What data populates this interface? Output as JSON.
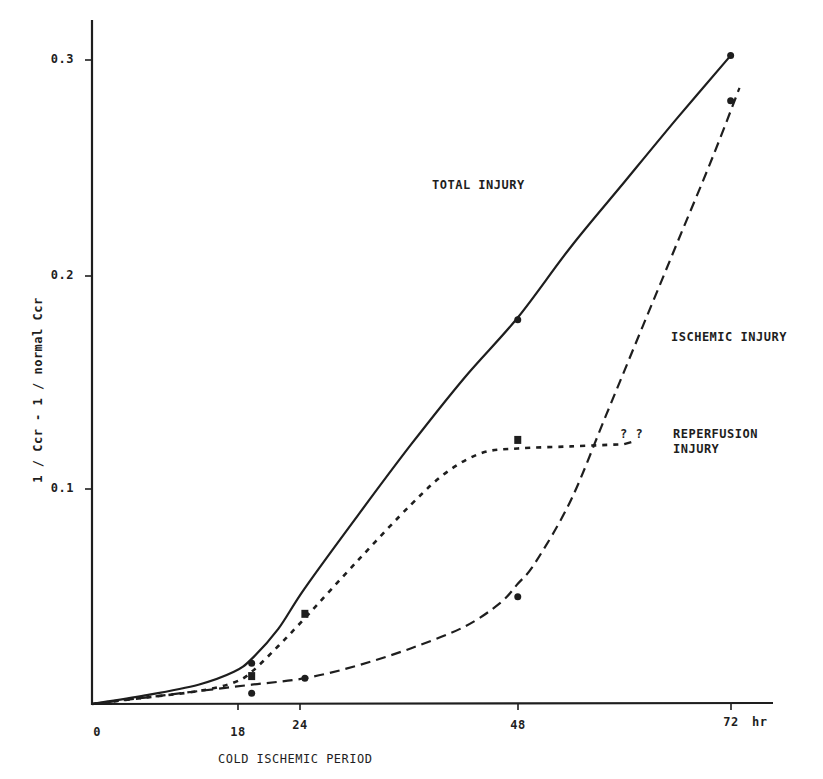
{
  "chart_data": {
    "type": "line",
    "title": "",
    "xlabel": "COLD ISCHEMIC PERIOD",
    "x_unit": "hr",
    "ylabel": "1 / Ccr - 1 / normal Ccr",
    "x_ticks": [
      "0",
      "18",
      "24",
      "48",
      "72"
    ],
    "y_ticks": [
      "0.1",
      "0.2",
      "0.3"
    ],
    "xlim": [
      0,
      77
    ],
    "ylim": [
      0,
      0.32
    ],
    "grid": false,
    "legend_position": "inline labels",
    "series": [
      {
        "name": "TOTAL INJURY",
        "line_style": "solid",
        "marker": "circle",
        "points": [
          {
            "x": 18,
            "y": 0.019
          },
          {
            "x": 48,
            "y": 0.179
          },
          {
            "x": 72,
            "y": 0.302
          }
        ],
        "curve": [
          [
            0,
            0
          ],
          [
            6,
            0.004
          ],
          [
            12,
            0.009
          ],
          [
            16,
            0.015
          ],
          [
            18,
            0.021
          ],
          [
            21,
            0.035
          ],
          [
            24,
            0.054
          ],
          [
            30,
            0.088
          ],
          [
            36,
            0.121
          ],
          [
            42,
            0.152
          ],
          [
            48,
            0.18
          ],
          [
            54,
            0.213
          ],
          [
            60,
            0.243
          ],
          [
            66,
            0.273
          ],
          [
            72,
            0.302
          ]
        ]
      },
      {
        "name": "REPERFUSION INJURY",
        "line_style": "dotted",
        "marker": "square",
        "points": [
          {
            "x": 18,
            "y": 0.013
          },
          {
            "x": 24,
            "y": 0.042
          },
          {
            "x": 48,
            "y": 0.123
          }
        ],
        "curve": [
          [
            0,
            0
          ],
          [
            6,
            0.003
          ],
          [
            12,
            0.006
          ],
          [
            16,
            0.01
          ],
          [
            18,
            0.015
          ],
          [
            21,
            0.027
          ],
          [
            24,
            0.04
          ],
          [
            30,
            0.067
          ],
          [
            36,
            0.093
          ],
          [
            40,
            0.108
          ],
          [
            44,
            0.117
          ],
          [
            48,
            0.119
          ],
          [
            54,
            0.12
          ],
          [
            60,
            0.121
          ]
        ],
        "annotation": "? ?"
      },
      {
        "name": "ISCHEMIC INJURY",
        "line_style": "dashed",
        "marker": "circle",
        "points": [
          {
            "x": 18,
            "y": 0.005
          },
          {
            "x": 24,
            "y": 0.012
          },
          {
            "x": 48,
            "y": 0.05
          },
          {
            "x": 72,
            "y": 0.281
          }
        ],
        "curve": [
          [
            0,
            0
          ],
          [
            6,
            0.003
          ],
          [
            12,
            0.006
          ],
          [
            18,
            0.009
          ],
          [
            24,
            0.012
          ],
          [
            30,
            0.018
          ],
          [
            36,
            0.026
          ],
          [
            42,
            0.036
          ],
          [
            46,
            0.047
          ],
          [
            48,
            0.056
          ],
          [
            50,
            0.066
          ],
          [
            54,
            0.095
          ],
          [
            58,
            0.135
          ],
          [
            62,
            0.175
          ],
          [
            66,
            0.215
          ],
          [
            70,
            0.255
          ],
          [
            73,
            0.287
          ]
        ]
      }
    ],
    "annotations": [
      {
        "text": "TOTAL INJURY"
      },
      {
        "text": "ISCHEMIC INJURY"
      },
      {
        "text": "? ?"
      },
      {
        "text": "REPERFUSION"
      },
      {
        "text": "INJURY"
      }
    ]
  },
  "labels": {
    "y_axis_title": "1 / Ccr  -  1 / normal Ccr",
    "x_axis_title": "COLD ISCHEMIC PERIOD",
    "x_unit": "hr",
    "x_ticks": [
      "0",
      "18",
      "24",
      "48",
      "72"
    ],
    "y_ticks": [
      "0.1",
      "0.2",
      "0.3"
    ],
    "total_injury": "TOTAL INJURY",
    "ischemic_injury": "ISCHEMIC INJURY",
    "question_marks": "?   ?",
    "reperfusion_line1": "REPERFUSION",
    "reperfusion_line2": "INJURY"
  }
}
